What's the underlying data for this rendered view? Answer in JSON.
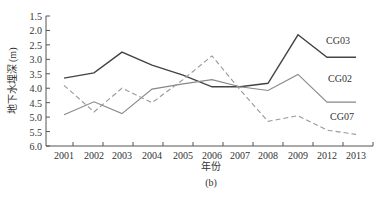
{
  "chart_data": {
    "type": "line",
    "title": "",
    "caption": "(b)",
    "xlabel": "年份",
    "ylabel": "地下水埋深 (m)",
    "ylim": [
      6.0,
      1.5
    ],
    "y_inverted": true,
    "yticks": [
      "1.5",
      "2.0",
      "2.5",
      "3.0",
      "3.5",
      "4.0",
      "4.5",
      "5.0",
      "5.5",
      "6.0"
    ],
    "categories": [
      "2001",
      "2002",
      "2003",
      "2004",
      "2005",
      "2006",
      "2007",
      "2008",
      "2009",
      "2012",
      "2013"
    ],
    "grid": false,
    "legend": "inline labels at right",
    "series": [
      {
        "name": "CG03",
        "style": "solid-dark",
        "color": "#444444",
        "values": [
          3.65,
          3.47,
          2.75,
          3.2,
          3.55,
          3.95,
          3.95,
          3.83,
          2.15,
          2.93,
          2.93
        ]
      },
      {
        "name": "CG02",
        "style": "solid-light",
        "color": "#888888",
        "values": [
          4.92,
          4.47,
          4.88,
          4.03,
          3.85,
          3.7,
          3.95,
          4.08,
          3.52,
          4.48,
          4.48
        ]
      },
      {
        "name": "CG07",
        "style": "dashed",
        "color": "#999999",
        "values": [
          3.9,
          4.82,
          4.0,
          4.5,
          3.7,
          2.88,
          4.05,
          5.15,
          4.95,
          5.45,
          5.6
        ]
      }
    ]
  }
}
